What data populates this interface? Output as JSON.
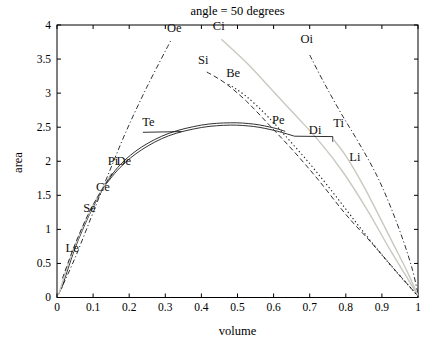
{
  "figure": {
    "title": "angle = 50 degrees",
    "xlabel": "volume",
    "ylabel": "area"
  },
  "chart_data": {
    "type": "line",
    "title": "angle = 50 degrees",
    "xlabel": "volume",
    "ylabel": "area",
    "xlim": [
      0,
      1
    ],
    "ylim": [
      0,
      4
    ],
    "grid": false,
    "legend_position": "none (curves labeled inline)",
    "xticks": [
      0,
      0.1,
      0.2,
      0.3,
      0.4,
      0.5,
      0.6,
      0.7,
      0.8,
      0.9,
      1
    ],
    "xtick_labels": [
      "0",
      "0.1",
      "0.2",
      "0.3",
      "0.4",
      "0.5",
      "0.6",
      "0.7",
      "0.8",
      "0.9",
      "1"
    ],
    "yticks": [
      0,
      0.5,
      1,
      1.5,
      2,
      2.5,
      3,
      3.5,
      4
    ],
    "ytick_labels": [
      "0",
      "0.5",
      "1",
      "1.5",
      "2",
      "2.5",
      "3",
      "3.5",
      "4"
    ],
    "colors": {
      "black_curve": "#1a1a1a",
      "gray_curve": "#c9c9c2",
      "axis": "#000000",
      "background": "#ffffff"
    },
    "series": [
      {
        "name": "Oe-curve",
        "label": "Oe",
        "style": "dashdot",
        "color": "#1a1a1a",
        "width": 0.9,
        "smooth": true,
        "points": [
          [
            0.004,
            0.04
          ],
          [
            0.05,
            0.58
          ],
          [
            0.095,
            1.18
          ],
          [
            0.14,
            1.78
          ],
          [
            0.19,
            2.42
          ],
          [
            0.25,
            3.1
          ],
          [
            0.315,
            3.77
          ]
        ]
      },
      {
        "name": "Ci-curve",
        "label": "Ci",
        "style": "solid",
        "color": "#c9c9c2",
        "width": 1.4,
        "smooth": true,
        "points": [
          [
            0.455,
            3.79
          ],
          [
            0.53,
            3.42
          ],
          [
            0.6,
            3.02
          ],
          [
            0.665,
            2.65
          ],
          [
            0.73,
            2.27
          ],
          [
            0.795,
            1.82
          ],
          [
            0.86,
            1.28
          ],
          [
            0.925,
            0.68
          ],
          [
            1,
            0.03
          ]
        ]
      },
      {
        "name": "Oi-curve",
        "label": "Oi",
        "style": "dashdot",
        "color": "#1a1a1a",
        "width": 0.9,
        "smooth": true,
        "points": [
          [
            0.7,
            3.56
          ],
          [
            0.74,
            3.15
          ],
          [
            0.785,
            2.72
          ],
          [
            0.835,
            2.28
          ],
          [
            0.885,
            1.8
          ],
          [
            0.925,
            1.32
          ],
          [
            0.96,
            0.82
          ],
          [
            0.985,
            0.4
          ],
          [
            1,
            0.05
          ]
        ]
      },
      {
        "name": "Si-curve",
        "label": "Si",
        "style": "dashed",
        "color": "#1a1a1a",
        "width": 0.9,
        "smooth": true,
        "points": [
          [
            0.415,
            3.31
          ],
          [
            0.465,
            3.15
          ],
          [
            0.525,
            2.88
          ],
          [
            0.59,
            2.52
          ],
          [
            0.655,
            2.15
          ],
          [
            0.725,
            1.72
          ],
          [
            0.8,
            1.22
          ],
          [
            0.875,
            0.78
          ],
          [
            0.94,
            0.38
          ],
          [
            1,
            0.02
          ]
        ]
      },
      {
        "name": "Be-curve",
        "label": "Be",
        "style": "dotted",
        "color": "#1a1a1a",
        "width": 1.1,
        "smooth": true,
        "points": [
          [
            0.475,
            3.13
          ],
          [
            0.525,
            2.95
          ],
          [
            0.585,
            2.65
          ],
          [
            0.65,
            2.27
          ],
          [
            0.715,
            1.87
          ],
          [
            0.785,
            1.4
          ],
          [
            0.855,
            0.92
          ],
          [
            0.925,
            0.47
          ],
          [
            1,
            0.02
          ]
        ]
      },
      {
        "name": "main-arc-upper",
        "label": "Pe",
        "style": "solid",
        "color": "#1a1a1a",
        "width": 0.9,
        "smooth": true,
        "points": [
          [
            0.128,
            1.62
          ],
          [
            0.175,
            1.95
          ],
          [
            0.235,
            2.21
          ],
          [
            0.31,
            2.41
          ],
          [
            0.4,
            2.53
          ],
          [
            0.48,
            2.565
          ],
          [
            0.545,
            2.545
          ],
          [
            0.6,
            2.49
          ],
          [
            0.632,
            2.44
          ]
        ]
      },
      {
        "name": "main-arc-lower",
        "label": "De",
        "style": "solid",
        "color": "#1a1a1a",
        "width": 0.9,
        "smooth": true,
        "points": [
          [
            0.122,
            1.57
          ],
          [
            0.175,
            1.91
          ],
          [
            0.235,
            2.17
          ],
          [
            0.31,
            2.375
          ],
          [
            0.4,
            2.495
          ],
          [
            0.48,
            2.53
          ],
          [
            0.545,
            2.51
          ],
          [
            0.6,
            2.455
          ],
          [
            0.638,
            2.4
          ]
        ]
      },
      {
        "name": "arc-tail",
        "label": "Ce",
        "style": "solid",
        "color": "#1a1a1a",
        "width": 0.9,
        "smooth": true,
        "points": [
          [
            0.012,
            0.12
          ],
          [
            0.05,
            0.72
          ],
          [
            0.09,
            1.22
          ],
          [
            0.128,
            1.6
          ]
        ]
      },
      {
        "name": "left-gray-curve",
        "label": "Se",
        "style": "solid",
        "color": "#c9c9c2",
        "width": 1.4,
        "smooth": true,
        "points": [
          [
            0.004,
            0.04
          ],
          [
            0.035,
            0.55
          ],
          [
            0.07,
            1.02
          ],
          [
            0.11,
            1.45
          ],
          [
            0.15,
            1.82
          ]
        ]
      },
      {
        "name": "left-dashed-curve",
        "label": "Le",
        "style": "dashed",
        "color": "#1a1a1a",
        "width": 0.9,
        "smooth": true,
        "points": [
          [
            0.015,
            0.28
          ],
          [
            0.05,
            0.78
          ],
          [
            0.09,
            1.26
          ],
          [
            0.13,
            1.63
          ],
          [
            0.158,
            1.86
          ]
        ]
      },
      {
        "name": "Te-line",
        "label": "Te",
        "style": "solid",
        "color": "#1a1a1a",
        "width": 0.9,
        "smooth": false,
        "points": [
          [
            0.238,
            2.425
          ],
          [
            0.345,
            2.435
          ]
        ]
      },
      {
        "name": "Di-line",
        "label": "Di",
        "style": "solid",
        "color": "#1a1a1a",
        "width": 0.9,
        "smooth": false,
        "points": [
          [
            0.638,
            2.4
          ],
          [
            0.658,
            2.368
          ],
          [
            0.764,
            2.362
          ],
          [
            0.764,
            2.285
          ]
        ]
      },
      {
        "name": "Li-gray-curve",
        "label": "Li",
        "style": "solid",
        "color": "#c9c9c2",
        "width": 1.4,
        "smooth": true,
        "points": [
          [
            0.766,
            2.32
          ],
          [
            0.8,
            2.08
          ],
          [
            0.845,
            1.68
          ],
          [
            0.89,
            1.22
          ],
          [
            0.935,
            0.75
          ],
          [
            0.97,
            0.38
          ],
          [
            1,
            0.03
          ]
        ]
      }
    ],
    "curve_labels": [
      {
        "text": "Oe",
        "x": 0.325,
        "y": 3.9
      },
      {
        "text": "Ci",
        "x": 0.448,
        "y": 3.93
      },
      {
        "text": "Oi",
        "x": 0.692,
        "y": 3.74
      },
      {
        "text": "Si",
        "x": 0.405,
        "y": 3.43
      },
      {
        "text": "Be",
        "x": 0.488,
        "y": 3.24
      },
      {
        "text": "Te",
        "x": 0.253,
        "y": 2.52
      },
      {
        "text": "Pe",
        "x": 0.613,
        "y": 2.54
      },
      {
        "text": "Di",
        "x": 0.715,
        "y": 2.4
      },
      {
        "text": "Ti",
        "x": 0.78,
        "y": 2.51
      },
      {
        "text": "Li",
        "x": 0.825,
        "y": 2.0
      },
      {
        "text": "Pi",
        "x": 0.155,
        "y": 1.94
      },
      {
        "text": "De",
        "x": 0.185,
        "y": 1.94
      },
      {
        "text": "Ce",
        "x": 0.127,
        "y": 1.57
      },
      {
        "text": "Se",
        "x": 0.09,
        "y": 1.26
      },
      {
        "text": "Le",
        "x": 0.042,
        "y": 0.67
      }
    ]
  }
}
